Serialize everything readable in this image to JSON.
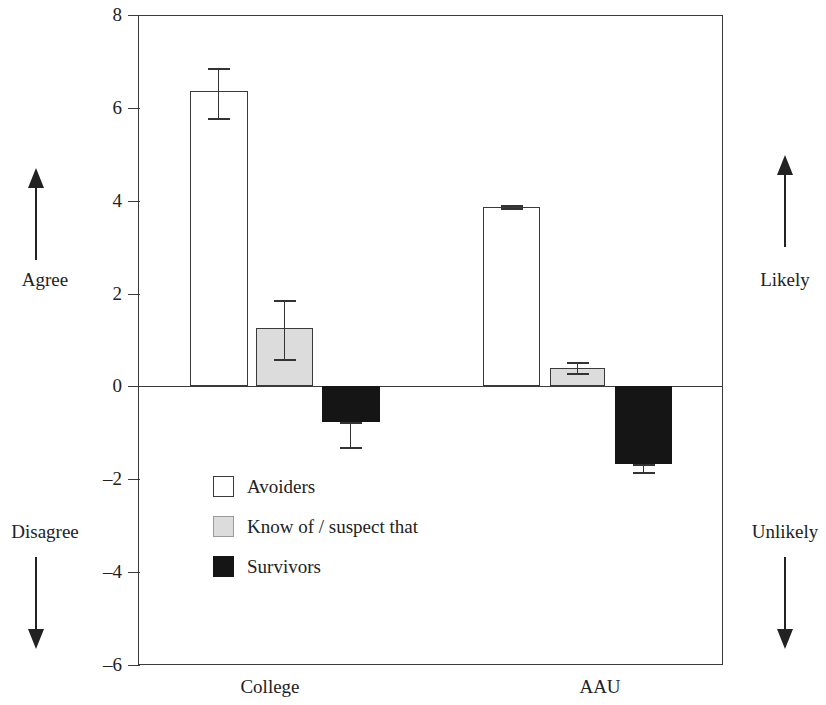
{
  "chart_data": {
    "type": "bar",
    "title": "",
    "subtitle": "",
    "xlabel": "",
    "ylabel": "",
    "categories": [
      "College",
      "AAU"
    ],
    "ylim": [
      -6,
      8
    ],
    "yticks": [
      8,
      6,
      4,
      2,
      0,
      -2,
      -4,
      -6
    ],
    "ytick_labels": [
      "8",
      "6",
      "4",
      "2",
      "0",
      "–2",
      "–4",
      "–6"
    ],
    "grid": false,
    "legend_position": "inside-lower-left",
    "error_bars": "present",
    "series": [
      {
        "name": "Avoiders",
        "color": "#ffffff",
        "edge_color": "#3a3a3a",
        "values": [
          6.37,
          3.87
        ],
        "err_low": [
          5.78,
          3.84
        ],
        "err_high": [
          6.86,
          3.9
        ]
      },
      {
        "name": "Know of / suspect that",
        "color": "#dcdcdc",
        "edge_color": "#3a3a3a",
        "values": [
          1.25,
          0.39
        ],
        "err_low": [
          0.6,
          0.28
        ],
        "err_high": [
          1.87,
          0.52
        ]
      },
      {
        "name": "Survivors",
        "color": "#151515",
        "edge_color": "#151515",
        "values": [
          -0.77,
          -1.68
        ],
        "err_low": [
          -1.31,
          -1.85
        ],
        "err_high": [
          -0.77,
          -1.68
        ]
      }
    ],
    "annotations": {
      "left_top": "Agree",
      "left_bottom": "Disagree",
      "right_top": "Likely",
      "right_bottom": "Unlikely"
    }
  },
  "axis": {
    "tick_labels": [
      "8",
      "6",
      "4",
      "2",
      "0",
      "–2",
      "–4",
      "–6"
    ]
  },
  "xaxis": {
    "labels": [
      "College",
      "AAU"
    ]
  },
  "legend": {
    "items": [
      {
        "label": "Avoiders"
      },
      {
        "label": "Know of / suspect that"
      },
      {
        "label": "Survivors"
      }
    ]
  },
  "annotations": {
    "left_top": "Agree",
    "left_bottom": "Disagree",
    "right_top": "Likely",
    "right_bottom": "Unlikely"
  }
}
